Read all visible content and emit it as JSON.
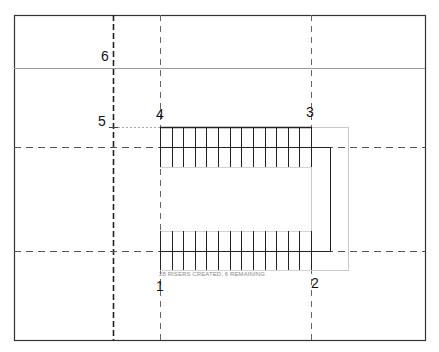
{
  "drawing": {
    "frame": {
      "x": 14,
      "y": 15,
      "w": 411,
      "h": 325,
      "color": "#333333"
    },
    "level_line": {
      "y": 68,
      "color": "#9a9a9a"
    },
    "grid_lines": [
      {
        "id": "6",
        "orientation": "vertical",
        "pos": 113,
        "style": "dash-dot-bold"
      },
      {
        "id": "1-4",
        "orientation": "vertical",
        "pos": 160,
        "style": "dashed"
      },
      {
        "id": "2-3",
        "orientation": "vertical",
        "pos": 311,
        "style": "dashed"
      },
      {
        "id": "upper",
        "orientation": "horizontal",
        "pos": 147,
        "style": "dashed"
      },
      {
        "id": "lower",
        "orientation": "horizontal",
        "pos": 251,
        "style": "dashed"
      }
    ],
    "labels": [
      {
        "text": "6",
        "x": 101,
        "y": 49
      },
      {
        "text": "5",
        "x": 98,
        "y": 114
      },
      {
        "text": "4",
        "x": 156,
        "y": 107
      },
      {
        "text": "3",
        "x": 306,
        "y": 105
      },
      {
        "text": "1",
        "x": 156,
        "y": 279
      },
      {
        "text": "2",
        "x": 311,
        "y": 276
      }
    ],
    "stair": {
      "upper_run": {
        "x1": 160,
        "x2": 311,
        "y1": 127,
        "y2": 167,
        "riser_count": 14
      },
      "lower_run": {
        "x1": 160,
        "x2": 311,
        "y1": 231,
        "y2": 270,
        "riser_count": 14
      },
      "landing": {
        "x1": 160,
        "x2": 330,
        "y1": 147,
        "y2": 251
      },
      "boundary_box": {
        "x1": 311,
        "x2": 348,
        "y1": 127,
        "y2": 270
      },
      "line_color": "#222222",
      "sketch_color": "#c8c8c8"
    },
    "status_text": "28 RISERS CREATED, 6 REMAINING"
  }
}
